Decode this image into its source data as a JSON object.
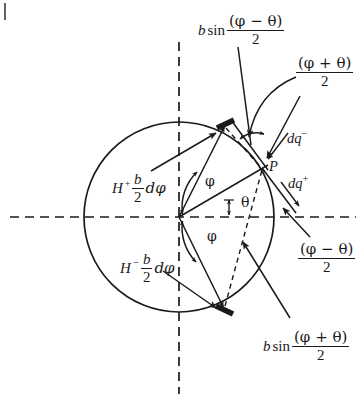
{
  "figure": {
    "background_color": "#ffffff",
    "ink_color": "#1a1a1a",
    "width": 364,
    "height": 402
  },
  "geometry": {
    "center": {
      "x": 179,
      "y": 217
    },
    "circle_radius": 95,
    "point_P": {
      "x": 267,
      "y": 163,
      "label": "P"
    },
    "horizontal_axis_y": 217,
    "vertical_axis_x": 179
  },
  "labels": {
    "top_expression": {
      "prefix_italic": "b",
      "func": "sin",
      "numerator": "(φ − θ)",
      "denominator": "2"
    },
    "bottom_expression": {
      "prefix_italic": "b",
      "func": "sin",
      "numerator": "(φ + θ)",
      "denominator": "2"
    },
    "upper_right_fraction": {
      "numerator": "(φ + θ)",
      "denominator": "2"
    },
    "lower_right_fraction": {
      "numerator": "(φ − θ)",
      "denominator": "2"
    },
    "dq_minus": {
      "base": "dq",
      "superscript": "−"
    },
    "dq_plus": {
      "base": "dq",
      "superscript": "+"
    },
    "h_plus": {
      "symbol": "H",
      "superscript": "+",
      "numerator": "b",
      "denominator": "2",
      "differential": "dφ"
    },
    "h_minus": {
      "symbol": "H",
      "superscript": "−",
      "numerator": "b",
      "denominator": "2",
      "differential": "dφ"
    },
    "angle_phi_upper": "φ",
    "angle_theta": "θ",
    "angle_phi_lower": "φ",
    "point_p": "P"
  }
}
